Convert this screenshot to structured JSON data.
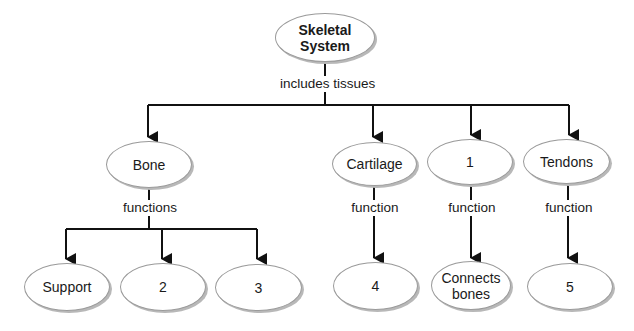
{
  "diagram": {
    "type": "concept-map",
    "root": {
      "label": "Skeletal System"
    },
    "root_link": "includes tissues",
    "tissues": [
      {
        "label": "Bone",
        "link": "functions",
        "children": [
          "Support",
          "2",
          "3"
        ]
      },
      {
        "label": "Cartilage",
        "link": "function",
        "children": [
          "4"
        ]
      },
      {
        "label": "1",
        "link": "function",
        "children": [
          "Connects bones"
        ]
      },
      {
        "label": "Tendons",
        "link": "function",
        "children": [
          "5"
        ]
      }
    ],
    "colors": {
      "line": "#111111",
      "oval_border": "#9a9a9a",
      "shadow": "#b8b8b8"
    }
  }
}
